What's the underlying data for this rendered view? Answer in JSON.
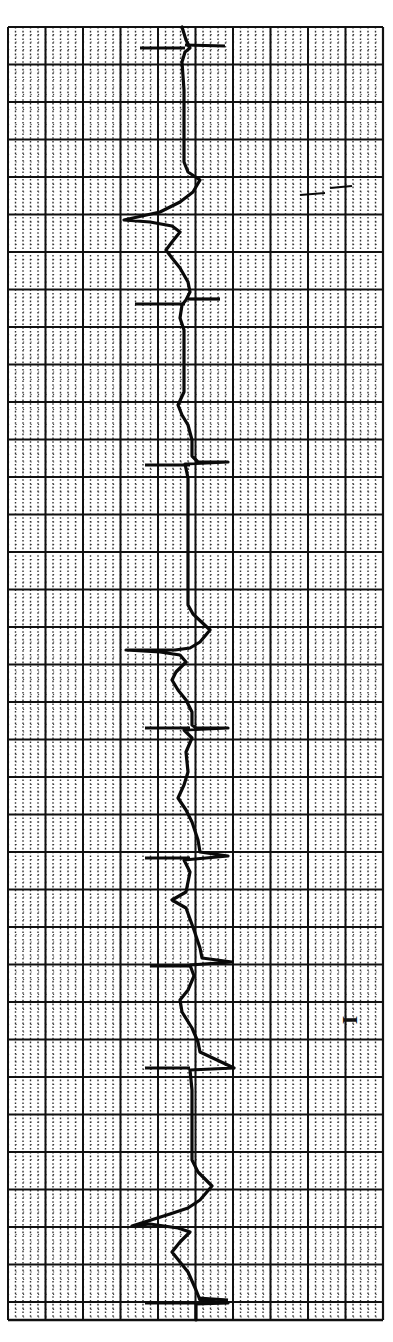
{
  "chart_data": {
    "type": "line",
    "lead": "I",
    "orientation": "vertical (time runs top to bottom)",
    "grid": {
      "on": true,
      "left": 8,
      "top": 27,
      "right": 383,
      "bottom": 1320,
      "major_spacing_px": 37.5,
      "minor_per_major": 5,
      "major_color": "#111111",
      "minor_color": "#333333"
    },
    "trace_color": "#0a0a0a",
    "calibration_marks_y": [
      48,
      300,
      464,
      728,
      858,
      963,
      1068,
      1303
    ],
    "beats": [
      {
        "label": "QRS",
        "y": 215
      },
      {
        "label": "QRS",
        "y": 650
      },
      {
        "label": "QRS",
        "y": 1225
      }
    ],
    "trace_points": [
      [
        182,
        27
      ],
      [
        186,
        40
      ],
      [
        190,
        48
      ],
      [
        185,
        52
      ],
      [
        182,
        62
      ],
      [
        184,
        90
      ],
      [
        184,
        130
      ],
      [
        184,
        162
      ],
      [
        188,
        172
      ],
      [
        200,
        180
      ],
      [
        193,
        192
      ],
      [
        180,
        202
      ],
      [
        160,
        212
      ],
      [
        124,
        220
      ],
      [
        150,
        222
      ],
      [
        172,
        226
      ],
      [
        180,
        232
      ],
      [
        172,
        242
      ],
      [
        166,
        250
      ],
      [
        172,
        258
      ],
      [
        180,
        268
      ],
      [
        188,
        282
      ],
      [
        190,
        292
      ],
      [
        186,
        300
      ],
      [
        182,
        305
      ],
      [
        180,
        318
      ],
      [
        184,
        330
      ],
      [
        184,
        360
      ],
      [
        184,
        392
      ],
      [
        178,
        405
      ],
      [
        182,
        415
      ],
      [
        188,
        425
      ],
      [
        192,
        440
      ],
      [
        192,
        456
      ],
      [
        198,
        462
      ],
      [
        228,
        462
      ],
      [
        185,
        464
      ],
      [
        188,
        478
      ],
      [
        188,
        520
      ],
      [
        188,
        580
      ],
      [
        188,
        605
      ],
      [
        193,
        614
      ],
      [
        210,
        630
      ],
      [
        200,
        642
      ],
      [
        190,
        648
      ],
      [
        175,
        650
      ],
      [
        126,
        650
      ],
      [
        160,
        652
      ],
      [
        180,
        655
      ],
      [
        186,
        662
      ],
      [
        176,
        672
      ],
      [
        172,
        680
      ],
      [
        178,
        690
      ],
      [
        186,
        700
      ],
      [
        192,
        712
      ],
      [
        192,
        725
      ],
      [
        196,
        728
      ],
      [
        228,
        728
      ],
      [
        184,
        730
      ],
      [
        192,
        738
      ],
      [
        186,
        752
      ],
      [
        188,
        772
      ],
      [
        184,
        785
      ],
      [
        178,
        798
      ],
      [
        186,
        810
      ],
      [
        192,
        822
      ],
      [
        198,
        840
      ],
      [
        200,
        852
      ],
      [
        228,
        856
      ],
      [
        184,
        860
      ],
      [
        190,
        872
      ],
      [
        188,
        882
      ],
      [
        186,
        892
      ],
      [
        172,
        900
      ],
      [
        186,
        908
      ],
      [
        194,
        930
      ],
      [
        200,
        948
      ],
      [
        202,
        958
      ],
      [
        232,
        962
      ],
      [
        190,
        965
      ],
      [
        194,
        976
      ],
      [
        188,
        990
      ],
      [
        180,
        1000
      ],
      [
        182,
        1012
      ],
      [
        192,
        1028
      ],
      [
        198,
        1042
      ],
      [
        200,
        1052
      ],
      [
        234,
        1068
      ],
      [
        190,
        1070
      ],
      [
        192,
        1090
      ],
      [
        192,
        1130
      ],
      [
        192,
        1160
      ],
      [
        198,
        1172
      ],
      [
        212,
        1186
      ],
      [
        200,
        1200
      ],
      [
        188,
        1208
      ],
      [
        170,
        1214
      ],
      [
        132,
        1226
      ],
      [
        150,
        1224
      ],
      [
        178,
        1228
      ],
      [
        190,
        1232
      ],
      [
        180,
        1242
      ],
      [
        172,
        1252
      ],
      [
        180,
        1262
      ],
      [
        188,
        1272
      ],
      [
        196,
        1290
      ],
      [
        200,
        1300
      ],
      [
        228,
        1303
      ],
      [
        196,
        1304
      ],
      [
        196,
        1320
      ]
    ],
    "calibration_ticks": [
      {
        "x1": 140,
        "y1": 48,
        "x2": 185,
        "y2": 48
      },
      {
        "x1": 185,
        "y1": 45,
        "x2": 225,
        "y2": 46
      },
      {
        "x1": 135,
        "y1": 304,
        "x2": 185,
        "y2": 304
      },
      {
        "x1": 188,
        "y1": 299,
        "x2": 220,
        "y2": 299
      },
      {
        "x1": 145,
        "y1": 465,
        "x2": 190,
        "y2": 465
      },
      {
        "x1": 145,
        "y1": 728,
        "x2": 190,
        "y2": 728
      },
      {
        "x1": 145,
        "y1": 858,
        "x2": 190,
        "y2": 858
      },
      {
        "x1": 150,
        "y1": 966,
        "x2": 192,
        "y2": 966
      },
      {
        "x1": 145,
        "y1": 1068,
        "x2": 190,
        "y2": 1068
      },
      {
        "x1": 145,
        "y1": 1303,
        "x2": 195,
        "y2": 1303
      },
      {
        "x1": 198,
        "y1": 1298,
        "x2": 228,
        "y2": 1300
      }
    ],
    "artifact_marks": [
      {
        "x1": 300,
        "y1": 195,
        "x2": 325,
        "y2": 193
      },
      {
        "x1": 330,
        "y1": 188,
        "x2": 352,
        "y2": 186
      }
    ]
  },
  "labels": {
    "lead_label": "I"
  }
}
